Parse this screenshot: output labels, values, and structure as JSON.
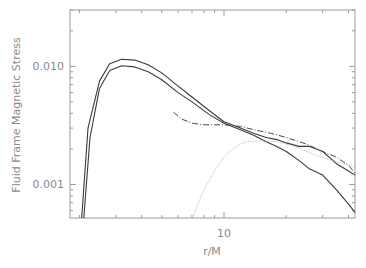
{
  "chart_data": {
    "type": "line",
    "title": "",
    "xlabel": "r/M",
    "ylabel": "Fluid Frame Magnetic Stress",
    "xscale": "log",
    "yscale": "log",
    "xlim": [
      1.8,
      43
    ],
    "ylim": [
      0.00052,
      0.03
    ],
    "x_tick_labels": [
      "10"
    ],
    "y_tick_labels": [
      "0.010",
      "0.001"
    ],
    "grid": false,
    "legend": null,
    "series": [
      {
        "name": "upper solid",
        "style": "solid",
        "x": [
          2.05,
          2.2,
          2.5,
          2.8,
          3.2,
          3.7,
          4.3,
          5.0,
          6.0,
          7.0,
          8.5,
          10,
          12,
          14,
          16,
          18,
          20,
          23,
          26,
          30,
          35,
          40,
          43
        ],
        "y": [
          0.00052,
          0.003,
          0.0075,
          0.0105,
          0.0115,
          0.0113,
          0.0103,
          0.0088,
          0.0068,
          0.0055,
          0.0042,
          0.0034,
          0.003,
          0.0027,
          0.0025,
          0.0024,
          0.00225,
          0.0021,
          0.0021,
          0.0019,
          0.0015,
          0.0013,
          0.0012
        ]
      },
      {
        "name": "lower solid",
        "style": "solid",
        "x": [
          2.1,
          2.25,
          2.5,
          2.8,
          3.2,
          3.7,
          4.3,
          5.0,
          6.0,
          7.0,
          8.5,
          10,
          12,
          14,
          16,
          18,
          20,
          23,
          26,
          30,
          35,
          40,
          43
        ],
        "y": [
          0.00052,
          0.0025,
          0.0065,
          0.0092,
          0.0101,
          0.0099,
          0.009,
          0.0077,
          0.006,
          0.005,
          0.0039,
          0.0033,
          0.0029,
          0.0026,
          0.0023,
          0.0021,
          0.0019,
          0.0016,
          0.00135,
          0.0012,
          0.0009,
          0.00068,
          0.00058
        ]
      },
      {
        "name": "dash-dot",
        "style": "dashdot",
        "x": [
          5.7,
          6.2,
          7.0,
          8.0,
          9.0,
          10,
          12,
          14,
          17,
          20,
          25,
          30,
          35,
          40,
          43
        ],
        "y": [
          0.0041,
          0.0036,
          0.0033,
          0.0032,
          0.0032,
          0.0032,
          0.0031,
          0.0029,
          0.0027,
          0.0025,
          0.0022,
          0.0019,
          0.0017,
          0.00145,
          0.00125
        ]
      },
      {
        "name": "dotted",
        "style": "dotted",
        "x": [
          7.1,
          7.5,
          8.0,
          9.0,
          10,
          11,
          12,
          13,
          15,
          18,
          22,
          27,
          33,
          40,
          43
        ],
        "y": [
          0.00052,
          0.0007,
          0.0009,
          0.0013,
          0.0017,
          0.002,
          0.0022,
          0.0023,
          0.00235,
          0.0023,
          0.0021,
          0.0018,
          0.0016,
          0.00145,
          0.0014
        ]
      }
    ],
    "colors": {
      "axes": "#9a9a9a",
      "text": "#8a8a8a",
      "solid": "#3a3a3a",
      "dashdot": "#4a4a4a",
      "dotted": "#aaaaaa"
    }
  }
}
